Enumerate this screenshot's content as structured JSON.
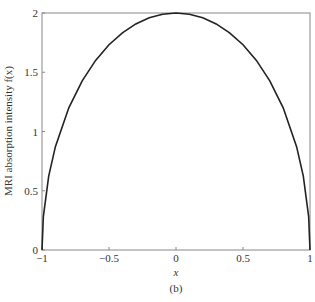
{
  "chart_data": {
    "type": "line",
    "title": "",
    "caption": "(b)",
    "xlabel": "x",
    "ylabel": "MRI absorption intensity f(x)",
    "xlim": [
      -1,
      1
    ],
    "ylim": [
      0,
      2
    ],
    "grid": false,
    "x_ticks": [
      -1,
      -0.5,
      0,
      0.5,
      1
    ],
    "x_tick_labels": [
      "−1",
      "−0.5",
      "0",
      "0.5",
      "1"
    ],
    "y_ticks": [
      0,
      0.5,
      1,
      1.5,
      2
    ],
    "y_tick_labels": [
      "0",
      "0.5",
      "1",
      "1.5",
      "2"
    ],
    "series": [
      {
        "name": "f(x)",
        "color": "#222222",
        "x": [
          -1,
          -0.99,
          -0.95,
          -0.9,
          -0.8,
          -0.7,
          -0.6,
          -0.5,
          -0.4,
          -0.3,
          -0.2,
          -0.1,
          0,
          0.1,
          0.2,
          0.3,
          0.4,
          0.5,
          0.6,
          0.7,
          0.8,
          0.9,
          0.95,
          0.99,
          1
        ],
        "y": [
          0,
          0.282,
          0.624,
          0.872,
          1.2,
          1.428,
          1.6,
          1.732,
          1.833,
          1.908,
          1.96,
          1.99,
          2,
          1.99,
          1.96,
          1.908,
          1.833,
          1.732,
          1.6,
          1.428,
          1.2,
          0.872,
          0.624,
          0.282,
          0
        ]
      }
    ]
  }
}
